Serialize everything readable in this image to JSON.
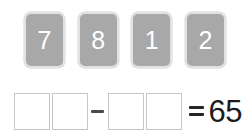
{
  "exercise": {
    "type": "subtraction-tile-puzzle",
    "tray": {
      "tiles": [
        {
          "digit": "7"
        },
        {
          "digit": "8"
        },
        {
          "digit": "1"
        },
        {
          "digit": "2"
        }
      ]
    },
    "equation": {
      "minuend_slots": [
        {
          "value": ""
        },
        {
          "value": ""
        }
      ],
      "subtrahend_slots": [
        {
          "value": ""
        },
        {
          "value": ""
        }
      ],
      "minus_symbol": "minus-sign",
      "equals_symbol": "equals-sign",
      "result": "65"
    }
  },
  "colors": {
    "background": "#ffffff",
    "tile_fill": "#a8a8a8",
    "tile_border": "#e2e2e2",
    "tile_digit": "#ffffff",
    "slot_border": "#c6c6c6",
    "slot_fill": "#ffffff",
    "minus_color": "#4a4a4a",
    "equals_color": "#252525",
    "result_color": "#1c1c1c"
  }
}
